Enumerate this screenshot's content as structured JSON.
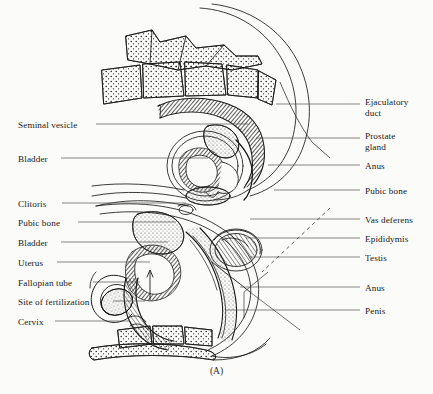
{
  "figure": {
    "caption": "(A)",
    "background_color": "#fbfbf9",
    "ink_color": "#1a1a1a",
    "leader_color": "#555555"
  },
  "labels_left": [
    {
      "text": "Seminal vesicle",
      "x": 18,
      "y": 120,
      "leader_x1": 96,
      "leader_x2": 248,
      "leader_y": 124
    },
    {
      "text": "Bladder",
      "x": 18,
      "y": 154,
      "leader_x1": 61,
      "leader_x2": 208,
      "leader_y": 158
    },
    {
      "text": "Clitoris",
      "x": 18,
      "y": 199,
      "leader_x1": 62,
      "leader_x2": 186,
      "leader_y": 203
    },
    {
      "text": "Pubic bone",
      "x": 18,
      "y": 218,
      "leader_x1": 78,
      "leader_x2": 176,
      "leader_y": 222
    },
    {
      "text": "Bladder",
      "x": 18,
      "y": 238,
      "leader_x1": 61,
      "leader_x2": 168,
      "leader_y": 242
    },
    {
      "text": "Uterus",
      "x": 18,
      "y": 258,
      "leader_x1": 57,
      "leader_x2": 150,
      "leader_y": 262
    },
    {
      "text": "Fallopian tube",
      "x": 18,
      "y": 278,
      "leader_x1": 93,
      "leader_x2": 140,
      "leader_y": 282
    },
    {
      "text": "Site of fertilization",
      "x": 18,
      "y": 297,
      "leader_x1": 113,
      "leader_x2": 145,
      "leader_y": 301
    },
    {
      "text": "Cervix",
      "x": 18,
      "y": 317,
      "leader_x1": 55,
      "leader_x2": 130,
      "leader_y": 321
    }
  ],
  "labels_right": [
    {
      "text": "Ejaculatory\nduct",
      "x": 365,
      "y": 97,
      "leader_x1": 276,
      "leader_x2": 360,
      "leader_y": 104
    },
    {
      "text": "Prostate\ngland",
      "x": 365,
      "y": 131,
      "leader_x1": 256,
      "leader_x2": 360,
      "leader_y": 138
    },
    {
      "text": "Anus",
      "x": 365,
      "y": 161,
      "leader_x1": 268,
      "leader_x2": 360,
      "leader_y": 165
    },
    {
      "text": "Pubic bone",
      "x": 365,
      "y": 186,
      "leader_x1": 274,
      "leader_x2": 360,
      "leader_y": 190
    },
    {
      "text": "Vas deferens",
      "x": 365,
      "y": 215,
      "leader_x1": 250,
      "leader_x2": 360,
      "leader_y": 219
    },
    {
      "text": "Epididymis",
      "x": 365,
      "y": 234,
      "leader_x1": 246,
      "leader_x2": 360,
      "leader_y": 238
    },
    {
      "text": "Testis",
      "x": 365,
      "y": 253,
      "leader_x1": 250,
      "leader_x2": 360,
      "leader_y": 257
    },
    {
      "text": "Anus",
      "x": 365,
      "y": 283,
      "leader_x1": 240,
      "leader_x2": 360,
      "leader_y": 287
    },
    {
      "text": "Penis",
      "x": 365,
      "y": 306,
      "leader_x1": 226,
      "leader_x2": 360,
      "leader_y": 310
    }
  ],
  "diagram_parts": [
    "vertebral-column-upper",
    "spinous-processes",
    "rectum-male",
    "bladder-male",
    "prostate-gland",
    "seminal-vesicle",
    "pubic-bone-male",
    "body-outline-male",
    "uterus",
    "fallopian-tube",
    "ovary",
    "cervix",
    "vagina",
    "clitoris",
    "bladder-female",
    "penis",
    "testis",
    "epididymis",
    "vas-deferens",
    "sacrum-coccyx-lower",
    "body-outline-female"
  ]
}
